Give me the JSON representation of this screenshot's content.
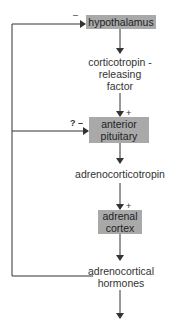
{
  "diagram": {
    "nodes": {
      "hypothalamus": "hypothalamus",
      "crf_line1": "corticotropin -",
      "crf_line2": "releasing",
      "crf_line3": "factor",
      "pituitary_line1": "anterior",
      "pituitary_line2": "pituitary",
      "acth": "adrenocorticotropin",
      "adrenal_line1": "adrenal",
      "adrenal_line2": "cortex",
      "hormones_line1": "adrenocortical",
      "hormones_line2": "hormones"
    },
    "signs": {
      "hypothalamus_feedback": "–",
      "pituitary_stimulation": "+",
      "pituitary_feedback": "? –",
      "adrenal_stimulation": "+"
    },
    "colors": {
      "box_fill": "#a9a9a9",
      "line": "#333333"
    }
  }
}
